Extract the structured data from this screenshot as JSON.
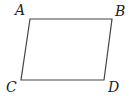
{
  "diagram": {
    "type": "parallelogram",
    "stroke_color": "#444444",
    "vertices": [
      {
        "label": "A",
        "x": 30,
        "y": 19
      },
      {
        "label": "B",
        "x": 112,
        "y": 19
      },
      {
        "label": "D",
        "x": 104,
        "y": 80
      },
      {
        "label": "C",
        "x": 21,
        "y": 80
      }
    ],
    "labels": {
      "A": "A",
      "B": "B",
      "C": "C",
      "D": "D"
    }
  }
}
